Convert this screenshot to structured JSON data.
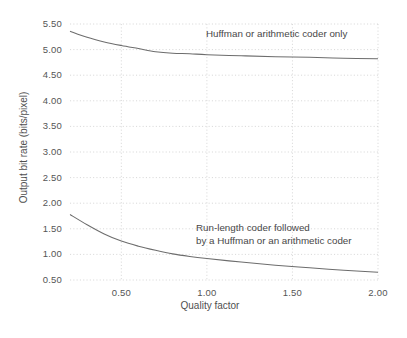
{
  "chart_data": {
    "type": "line",
    "title": "",
    "xlabel": "Quality factor",
    "ylabel": "Output bit rate  (bits/pixel)",
    "xlim": [
      0.2,
      2.0
    ],
    "ylim": [
      0.4,
      5.55
    ],
    "xticks": [
      "0.50",
      "1.00",
      "1.50",
      "2.00"
    ],
    "xtick_values": [
      0.5,
      1.0,
      1.5,
      2.0
    ],
    "yticks": [
      "0.50",
      "1.00",
      "1.50",
      "2.00",
      "2.50",
      "3.00",
      "3.50",
      "4.00",
      "4.50",
      "5.00",
      "5.50"
    ],
    "ytick_values": [
      0.5,
      1.0,
      1.5,
      2.0,
      2.5,
      3.0,
      3.5,
      4.0,
      4.5,
      5.0,
      5.5
    ],
    "grid": true,
    "grid_style": "dotted-horizontal-and-vertical",
    "legend": "inline-annotations",
    "series": [
      {
        "name": "Huffman or arithmetic coder only",
        "annotation": "Huffman or arithmetic coder only",
        "x": [
          0.2,
          0.3,
          0.4,
          0.5,
          0.6,
          0.7,
          0.8,
          0.9,
          1.0,
          1.2,
          1.4,
          1.6,
          1.8,
          2.0
        ],
        "values": [
          5.36,
          5.24,
          5.15,
          5.08,
          5.02,
          4.96,
          4.93,
          4.92,
          4.9,
          4.88,
          4.86,
          4.85,
          4.83,
          4.82
        ]
      },
      {
        "name": "Run-length coder followed by a Huffman or an arithmetic coder",
        "annotation_line1": "Run-length coder followed",
        "annotation_line2": "by a Huffman or an arithmetic coder",
        "x": [
          0.2,
          0.3,
          0.4,
          0.5,
          0.6,
          0.7,
          0.8,
          0.9,
          1.0,
          1.2,
          1.4,
          1.6,
          1.8,
          2.0
        ],
        "values": [
          1.78,
          1.58,
          1.4,
          1.26,
          1.16,
          1.08,
          1.01,
          0.96,
          0.92,
          0.85,
          0.79,
          0.74,
          0.69,
          0.65
        ]
      }
    ],
    "colors": {
      "curve": "#6d6d6d",
      "grid": "#c9c9c9",
      "text": "#4a4a4a",
      "background": "#ffffff"
    }
  }
}
